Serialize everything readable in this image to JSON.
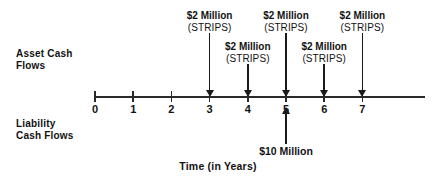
{
  "chart_data": {
    "type": "timeline",
    "title": "",
    "xlabel": "Time (in Years)",
    "xlim": [
      0,
      7
    ],
    "grid": false,
    "legend": "none",
    "row_labels": {
      "asset": "Asset Cash\nFlows",
      "liability": "Liability\nCash Flows"
    },
    "x_ticks": [
      {
        "value": 0,
        "label": "0"
      },
      {
        "value": 1,
        "label": "1"
      },
      {
        "value": 2,
        "label": "2"
      },
      {
        "value": 3,
        "label": "3"
      },
      {
        "value": 4,
        "label": "4"
      },
      {
        "value": 5,
        "label": "5"
      },
      {
        "value": 6,
        "label": "6"
      },
      {
        "value": 7,
        "label": "7"
      }
    ],
    "asset_cash_flows": [
      {
        "year": 3,
        "amount": "$2 Million",
        "instrument": "(STRIPS)",
        "tier": "upper",
        "direction": "down"
      },
      {
        "year": 4,
        "amount": "$2 Million",
        "instrument": "(STRIPS)",
        "tier": "lower",
        "direction": "down"
      },
      {
        "year": 5,
        "amount": "$2 Million",
        "instrument": "(STRIPS)",
        "tier": "upper",
        "direction": "down"
      },
      {
        "year": 6,
        "amount": "$2 Million",
        "instrument": "(STRIPS)",
        "tier": "lower",
        "direction": "down"
      },
      {
        "year": 7,
        "amount": "$2 Million",
        "instrument": "(STRIPS)",
        "tier": "upper",
        "direction": "down"
      }
    ],
    "liability_cash_flows": [
      {
        "year": 5,
        "amount": "$10 Million",
        "direction": "up"
      }
    ],
    "colors": {
      "ink": "#141414",
      "axis": "#2a2a2a",
      "background": "#ffffff"
    }
  }
}
